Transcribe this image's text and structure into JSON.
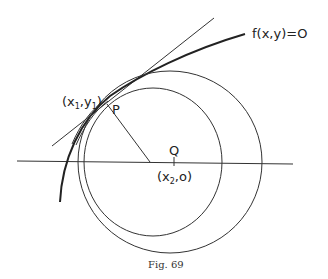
{
  "figure": {
    "caption": "Fig. 69",
    "labels": {
      "curve": "f(x,y)=O",
      "point_p_coords": "(x1,y1)",
      "point_p_coords_parts": {
        "open": "(x",
        "sub1": "1",
        "mid": ",y",
        "sub2": "1",
        "close": ")"
      },
      "point_p": "P",
      "point_q": "Q",
      "point_q_coords_parts": {
        "open": "(x",
        "sub": "2",
        "close": ",o)"
      }
    },
    "elements": [
      "curve f(x,y)=0",
      "tangent line at P",
      "x-axis",
      "small circle",
      "large circle",
      "normal segment P to axis",
      "tick at Q"
    ]
  }
}
